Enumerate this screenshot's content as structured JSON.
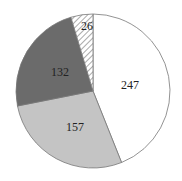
{
  "chart_data": {
    "type": "pie",
    "title": "",
    "start_angle": "top",
    "direction": "clockwise",
    "slices": [
      {
        "label": "247",
        "value": 247,
        "color": "#ffffff",
        "pattern": "none"
      },
      {
        "label": "157",
        "value": 157,
        "color": "#c4c4c4",
        "pattern": "none"
      },
      {
        "label": "132",
        "value": 132,
        "color": "#6b6b6b",
        "pattern": "none"
      },
      {
        "label": "26",
        "value": 26,
        "color": "#ffffff",
        "pattern": "diagonal-hatch"
      }
    ],
    "legend": "none"
  }
}
